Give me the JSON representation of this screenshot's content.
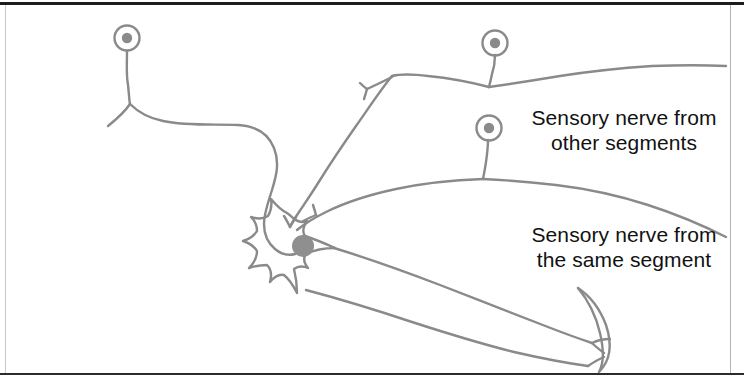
{
  "figure": {
    "kind": "neuron-reflex-diagram",
    "background_color": "#ffffff",
    "frame_color": "#1c1c1c",
    "stroke_color": "#8a8a8a",
    "nucleus_color": "#8f8f8f",
    "receptor_dot_color": "#8a8a8a",
    "text_color": "#111111"
  },
  "labels": {
    "other_segments": {
      "line1": "Sensory nerve from",
      "line2": "other segments"
    },
    "same_segment": {
      "line1": "Sensory nerve from",
      "line2": "the same segment"
    }
  },
  "parts": {
    "soma": "star-shaped neuron cell body",
    "nucleus": "nucleus",
    "axon": "axon",
    "muscle": "muscle fiber",
    "receptor_top_left": "sensory receptor",
    "receptor_top_right": "sensory receptor",
    "receptor_middle_right": "sensory receptor"
  }
}
